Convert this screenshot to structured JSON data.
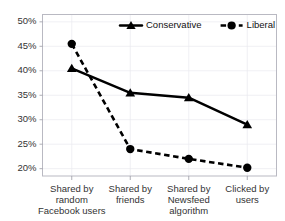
{
  "chart_data": {
    "type": "line",
    "title": "",
    "subtitle": "",
    "xlabel": "",
    "ylabel": "",
    "ylim": [
      18.5,
      51.5
    ],
    "yticks": [
      20,
      25,
      30,
      35,
      40,
      45,
      50
    ],
    "ytick_labels": [
      "20%",
      "25%",
      "30%",
      "35%",
      "40%",
      "45%",
      "50%"
    ],
    "grid": true,
    "legend_position": "top-center",
    "categories": [
      "Shared by random Facebook users",
      "Shared by friends",
      "Shared by Newsfeed algorithm",
      "Clicked by users"
    ],
    "category_lines": [
      [
        "Shared by",
        "random",
        "Facebook users"
      ],
      [
        "Shared by",
        "friends",
        ""
      ],
      [
        "Shared by",
        "Newsfeed",
        "algorithm"
      ],
      [
        "Clicked by",
        "users",
        ""
      ]
    ],
    "series": [
      {
        "name": "Conservative",
        "marker": "triangle",
        "line_style": "solid",
        "color": "#000000",
        "values": [
          40.5,
          35.5,
          34.5,
          29.0
        ]
      },
      {
        "name": "Liberal",
        "marker": "circle",
        "line_style": "dashed",
        "color": "#000000",
        "values": [
          45.5,
          24.0,
          22.0,
          20.2
        ]
      }
    ]
  },
  "legend": {
    "items": [
      {
        "label": "Conservative"
      },
      {
        "label": "Liberal"
      }
    ]
  },
  "axis": {
    "ytick_labels": [
      "50%",
      "45%",
      "40%",
      "35%",
      "30%",
      "25%",
      "20%"
    ]
  }
}
